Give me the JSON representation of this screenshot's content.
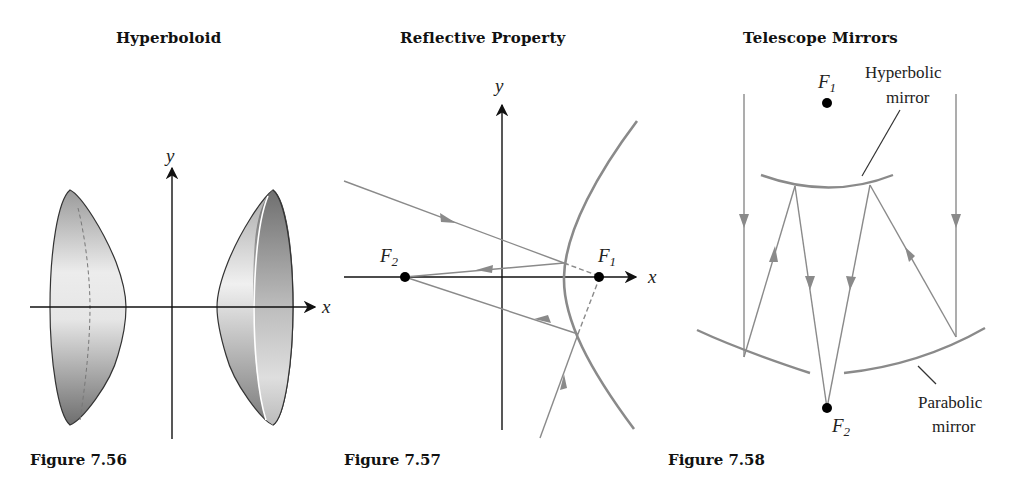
{
  "figures": [
    {
      "title": "Hyperboloid",
      "caption": "Figure 7.56",
      "axes": {
        "x_label": "x",
        "y_label": "y"
      }
    },
    {
      "title": "Reflective Property",
      "caption": "Figure 7.57",
      "axes": {
        "x_label": "x",
        "y_label": "y"
      },
      "foci": [
        {
          "name": "F",
          "sub": "1"
        },
        {
          "name": "F",
          "sub": "2"
        }
      ]
    },
    {
      "title": "Telescope Mirrors",
      "caption": "Figure 7.58",
      "foci": [
        {
          "name": "F",
          "sub": "1"
        },
        {
          "name": "F",
          "sub": "2"
        }
      ],
      "annotations": {
        "hyperbolic_line1": "Hyperbolic",
        "hyperbolic_line2": "mirror",
        "parabolic_line1": "Parabolic",
        "parabolic_line2": "mirror"
      }
    }
  ],
  "colors": {
    "axis": "#111111",
    "curve": "#888888",
    "ray": "#8a8a8a",
    "focus": "#000000"
  }
}
